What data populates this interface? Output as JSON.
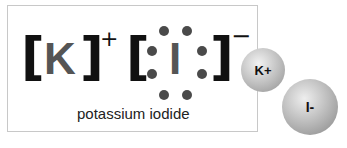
{
  "lewis_structure": {
    "cation": {
      "symbol": "K",
      "charge": "+",
      "left_bracket": "[",
      "right_bracket": "]"
    },
    "anion": {
      "symbol": "I",
      "charge": "−",
      "left_bracket": "[",
      "right_bracket": "]",
      "lone_pairs": 4,
      "electrons": 8
    },
    "caption": "potassium iodide"
  },
  "ion_models": [
    {
      "label": "K+",
      "color": "#bdbdbd"
    },
    {
      "label": "I-",
      "color": "#b5b5b5"
    }
  ],
  "colors": {
    "bracket": "#111111",
    "element_symbol": "#555555",
    "electron_dot": "#4a4a4a",
    "box_border": "#c8c8c8"
  }
}
